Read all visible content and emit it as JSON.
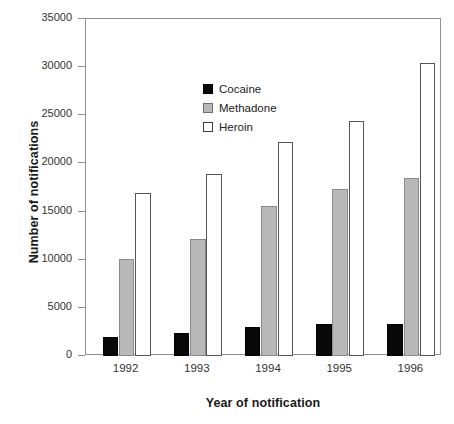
{
  "chart_data": {
    "type": "bar",
    "title": "",
    "xlabel": "Year of notification",
    "ylabel": "Number of notifications",
    "categories": [
      "1992",
      "1993",
      "1994",
      "1995",
      "1996"
    ],
    "series": [
      {
        "name": "Cocaine",
        "color": "#080808",
        "values": [
          2000,
          2400,
          3000,
          3300,
          3300
        ]
      },
      {
        "name": "Methadone",
        "color": "#b8b8b8",
        "values": [
          10100,
          12200,
          15600,
          17300,
          18500
        ]
      },
      {
        "name": "Heroin",
        "color": "#ffffff",
        "values": [
          16900,
          18900,
          22200,
          24400,
          30400
        ]
      }
    ],
    "ylim": [
      0,
      35000
    ],
    "yticks": [
      0,
      5000,
      10000,
      15000,
      20000,
      25000,
      30000,
      35000
    ],
    "ytick_labels": [
      "0",
      "5000",
      "10000",
      "15000",
      "20000",
      "25000",
      "30000",
      "35000"
    ],
    "grid": false,
    "legend_position": "upper-left-inside"
  }
}
